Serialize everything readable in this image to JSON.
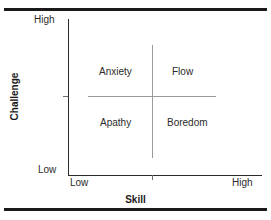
{
  "figure": {
    "clipped_title_remnant": "",
    "rules": {
      "color": "#1a1a1a"
    }
  },
  "axes": {
    "x": {
      "title": "Skill",
      "low_label": "Low",
      "high_label": "High"
    },
    "y": {
      "title": "Challenge",
      "low_label": "Low",
      "high_label": "High"
    }
  },
  "quadrants": [
    {
      "key": "anxiety",
      "label": "Anxiety"
    },
    {
      "key": "flow",
      "label": "Flow"
    },
    {
      "key": "apathy",
      "label": "Apathy"
    },
    {
      "key": "boredom",
      "label": "Boredom"
    }
  ],
  "chart_data": {
    "type": "scatter",
    "title": "",
    "xlabel": "Skill",
    "ylabel": "Challenge",
    "xlim": [
      0,
      1
    ],
    "ylim": [
      0,
      1
    ],
    "xticklabels": [
      "Low",
      "High"
    ],
    "yticklabels": [
      "Low",
      "High"
    ],
    "grid": false,
    "legend": null,
    "annotations": [
      {
        "text": "Anxiety",
        "x": 0.32,
        "y": 0.7,
        "quadrant": "top-left"
      },
      {
        "text": "Flow",
        "x": 0.72,
        "y": 0.7,
        "quadrant": "top-right"
      },
      {
        "text": "Apathy",
        "x": 0.32,
        "y": 0.37,
        "quadrant": "bottom-left"
      },
      {
        "text": "Boredom",
        "x": 0.72,
        "y": 0.37,
        "quadrant": "bottom-right"
      }
    ],
    "dividers": [
      {
        "orientation": "horizontal",
        "value": 0.5
      },
      {
        "orientation": "vertical",
        "value": 0.44
      }
    ],
    "colors": {
      "axis": "#2b2b2b",
      "divider": "#9a9a9a",
      "rule": "#1a1a1a",
      "text": "#2b2b2b"
    }
  }
}
